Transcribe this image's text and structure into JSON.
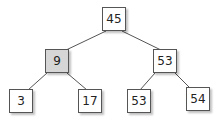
{
  "tree": {
    "nodes": [
      {
        "id": "n45",
        "value": "45",
        "x": 102,
        "y": 7,
        "highlight": false
      },
      {
        "id": "n9",
        "value": "9",
        "x": 45,
        "y": 49,
        "highlight": true
      },
      {
        "id": "n53r",
        "value": "53",
        "x": 153,
        "y": 49,
        "highlight": false
      },
      {
        "id": "n3",
        "value": "3",
        "x": 9,
        "y": 89,
        "highlight": false
      },
      {
        "id": "n17",
        "value": "17",
        "x": 78,
        "y": 89,
        "highlight": false
      },
      {
        "id": "n53b",
        "value": "53",
        "x": 127,
        "y": 89,
        "highlight": false
      },
      {
        "id": "n54",
        "value": "54",
        "x": 186,
        "y": 87,
        "highlight": false
      }
    ],
    "edges": [
      {
        "from": "n45",
        "to": "n9"
      },
      {
        "from": "n45",
        "to": "n53r"
      },
      {
        "from": "n9",
        "to": "n3"
      },
      {
        "from": "n9",
        "to": "n17"
      },
      {
        "from": "n53r",
        "to": "n53b"
      },
      {
        "from": "n53r",
        "to": "n54"
      }
    ],
    "colors": {
      "edge": "#555555",
      "highlight_fill": "#d6d6d6",
      "node_fill": "#ffffff"
    }
  }
}
